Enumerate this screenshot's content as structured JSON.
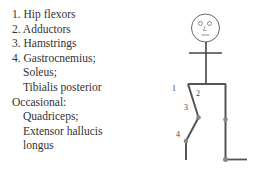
{
  "muscle_list": {
    "items": [
      {
        "text": "1. Hip flexors",
        "indent": false
      },
      {
        "text": "2. Adductors",
        "indent": false
      },
      {
        "text": "3. Hamstrings",
        "indent": false
      },
      {
        "text": "4. Gastrocnemius;",
        "indent": false
      },
      {
        "text": "Soleus;",
        "indent": true
      },
      {
        "text": "Tibialis posterior",
        "indent": true
      },
      {
        "text": "Occasional:",
        "indent": false
      },
      {
        "text": "Quadriceps;",
        "indent": true
      },
      {
        "text": "Extensor hallucis",
        "indent": true
      },
      {
        "text": "longus",
        "indent": true
      }
    ]
  },
  "figure": {
    "labels": {
      "label_1": "1",
      "label_2": "2",
      "label_3": "3",
      "label_4": "4"
    },
    "line_color": "#555555",
    "joint_color": "#777777"
  }
}
